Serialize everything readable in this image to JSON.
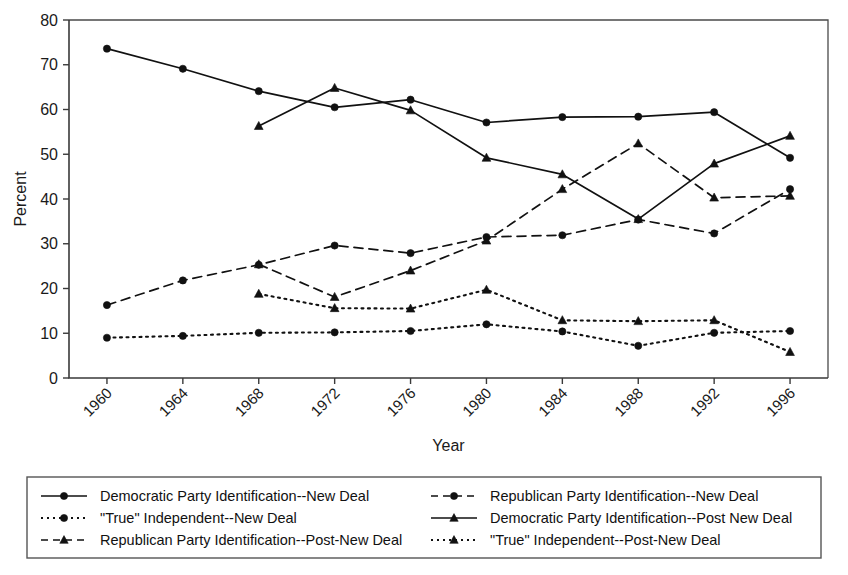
{
  "chart_data": {
    "type": "line",
    "title": "",
    "xlabel": "Year",
    "ylabel": "Percent",
    "x": [
      1960,
      1964,
      1968,
      1972,
      1976,
      1980,
      1984,
      1988,
      1992,
      1996
    ],
    "categories": [
      "1960",
      "1964",
      "1968",
      "1972",
      "1976",
      "1980",
      "1984",
      "1988",
      "1992",
      "1996"
    ],
    "xlim": [
      1958,
      1998
    ],
    "ylim": [
      0,
      80
    ],
    "yticks": [
      0,
      10,
      20,
      30,
      40,
      50,
      60,
      70,
      80
    ],
    "grid": false,
    "legend_position": "bottom",
    "series": [
      {
        "name": "Democratic Party Identification--New Deal",
        "style": "solid",
        "marker": "circle",
        "x": [
          1960,
          1964,
          1968,
          1972,
          1976,
          1980,
          1984,
          1988,
          1992,
          1996
        ],
        "values": [
          73.6,
          69.1,
          64.1,
          60.5,
          62.2,
          57.1,
          58.3,
          58.4,
          59.4,
          49.2
        ]
      },
      {
        "name": "Republican Party Identification--New Deal",
        "style": "dashed",
        "marker": "circle",
        "x": [
          1960,
          1964,
          1968,
          1972,
          1976,
          1980,
          1984,
          1988,
          1992,
          1996
        ],
        "values": [
          16.3,
          21.8,
          25.3,
          29.6,
          27.9,
          31.5,
          31.9,
          35.4,
          32.3,
          42.2
        ]
      },
      {
        "name": "\"True\" Independent--New Deal",
        "style": "dotted",
        "marker": "circle",
        "x": [
          1960,
          1964,
          1968,
          1972,
          1976,
          1980,
          1984,
          1988,
          1992,
          1996
        ],
        "values": [
          9.0,
          9.4,
          10.1,
          10.2,
          10.5,
          12.0,
          10.4,
          7.2,
          10.1,
          10.5
        ]
      },
      {
        "name": "Democratic Party Identification--Post New Deal",
        "style": "solid",
        "marker": "triangle",
        "x": [
          1968,
          1972,
          1976,
          1980,
          1984,
          1988,
          1992,
          1996
        ],
        "values": [
          56.3,
          64.8,
          59.8,
          49.2,
          45.5,
          35.5,
          47.9,
          54.1
        ]
      },
      {
        "name": "Republican Party Identification--Post-New Deal",
        "style": "dashed",
        "marker": "triangle",
        "x": [
          1968,
          1972,
          1976,
          1980,
          1984,
          1988,
          1992,
          1996
        ],
        "values": [
          25.4,
          18.1,
          24.0,
          30.7,
          42.2,
          52.4,
          40.3,
          40.7
        ]
      },
      {
        "name": "\"True\" Independent--Post-New Deal",
        "style": "dotted",
        "marker": "triangle",
        "x": [
          1968,
          1972,
          1976,
          1980,
          1984,
          1988,
          1992,
          1996
        ],
        "values": [
          18.8,
          15.6,
          15.5,
          19.7,
          12.9,
          12.7,
          12.9,
          5.8
        ]
      }
    ],
    "legend": [
      {
        "label": "Democratic Party Identification--New Deal",
        "style": "solid",
        "marker": "circle",
        "column": 0,
        "row": 0
      },
      {
        "label": "\"True\" Independent--New Deal",
        "style": "dotted",
        "marker": "circle",
        "column": 0,
        "row": 1
      },
      {
        "label": "Republican Party Identification--Post-New Deal",
        "style": "dashed",
        "marker": "triangle",
        "column": 0,
        "row": 2
      },
      {
        "label": "Republican Party Identification--New Deal",
        "style": "dashed",
        "marker": "circle",
        "column": 1,
        "row": 0
      },
      {
        "label": "Democratic Party Identification--Post New Deal",
        "style": "solid",
        "marker": "triangle",
        "column": 1,
        "row": 1
      },
      {
        "label": "\"True\" Independent--Post-New Deal",
        "style": "dotted",
        "marker": "triangle",
        "column": 1,
        "row": 2
      }
    ],
    "colors": {
      "line": "#111111",
      "axis": "#3a3a3a",
      "text": "#1a1a1a",
      "background": "#ffffff"
    }
  }
}
